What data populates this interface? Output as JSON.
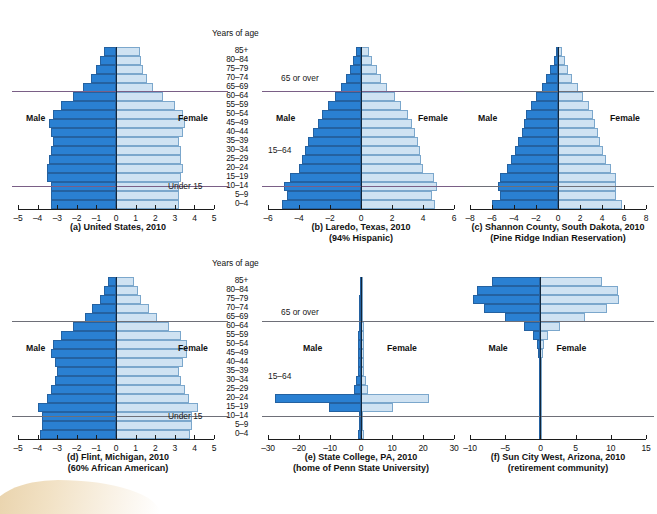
{
  "figure": {
    "age_axis_title": "Years of age",
    "age_groups": [
      "85+",
      "80–84",
      "75–79",
      "70–74",
      "65–69",
      "60–64",
      "55–59",
      "50–54",
      "45–49",
      "40–44",
      "35–39",
      "30–34",
      "25–29",
      "20–24",
      "15–19",
      "10–14",
      "5–9",
      "0–4"
    ],
    "male_label": "Male",
    "female_label": "Female",
    "note_over65": "65 or over",
    "note_15_64": "15–64",
    "note_under15": "Under 15",
    "colors": {
      "male": "#2a80d2",
      "female": "#cfe2f2",
      "male_edge": "#2461a0",
      "female_edge": "#7ba7cc",
      "axis": "#1c1c1c",
      "divider": "#6e6f78"
    }
  },
  "chart_data": [
    {
      "type": "bar",
      "id": "a",
      "title": "(a) United States, 2010",
      "subtitle": "",
      "xlabel": "",
      "ylabel": "Years of age",
      "xlim": [
        -5,
        5
      ],
      "xticks": [
        -5,
        -4,
        -3,
        -2,
        -1,
        0,
        1,
        2,
        3,
        4,
        5
      ],
      "xticklabels": [
        "–5",
        "–4",
        "–3",
        "–2",
        "–1",
        "0",
        "1",
        "2",
        "3",
        "4",
        "5"
      ],
      "categories": [
        "85+",
        "80–84",
        "75–79",
        "70–74",
        "65–69",
        "60–64",
        "55–59",
        "50–54",
        "45–49",
        "40–44",
        "35–39",
        "30–34",
        "25–29",
        "20–24",
        "15–19",
        "10–14",
        "5–9",
        "0–4"
      ],
      "series": [
        {
          "name": "Male",
          "values": [
            -0.6,
            -0.8,
            -1.0,
            -1.3,
            -1.7,
            -2.2,
            -2.8,
            -3.2,
            -3.4,
            -3.3,
            -3.2,
            -3.3,
            -3.4,
            -3.5,
            -3.5,
            -3.3,
            -3.3,
            -3.3
          ]
        },
        {
          "name": "Female",
          "values": [
            1.2,
            1.3,
            1.4,
            1.6,
            1.9,
            2.4,
            3.0,
            3.4,
            3.5,
            3.4,
            3.2,
            3.3,
            3.3,
            3.4,
            3.3,
            3.2,
            3.2,
            3.2
          ]
        }
      ],
      "dividers": [
        {
          "label": "65 or over",
          "between": "65–69/60–64"
        },
        {
          "label": "Under 15",
          "between": "15–19/10–14"
        }
      ],
      "legend": "none",
      "grid": false
    },
    {
      "type": "bar",
      "id": "b",
      "title": "(b) Laredo, Texas, 2010",
      "subtitle": "(94% Hispanic)",
      "xlim": [
        -6,
        6
      ],
      "xticks": [
        -6,
        -4,
        -2,
        0,
        2,
        4,
        6
      ],
      "xticklabels": [
        "–6",
        "–4",
        "–2",
        "0",
        "2",
        "4",
        "6"
      ],
      "categories": [
        "85+",
        "80–84",
        "75–79",
        "70–74",
        "65–69",
        "60–64",
        "55–59",
        "50–54",
        "45–49",
        "40–44",
        "35–39",
        "30–34",
        "25–29",
        "20–24",
        "15–19",
        "10–14",
        "5–9",
        "0–4"
      ],
      "series": [
        {
          "name": "Male",
          "values": [
            -0.3,
            -0.5,
            -0.7,
            -1.0,
            -1.3,
            -1.7,
            -2.1,
            -2.5,
            -2.8,
            -3.1,
            -3.4,
            -3.6,
            -3.8,
            -4.0,
            -4.6,
            -5.0,
            -4.8,
            -5.1
          ]
        },
        {
          "name": "Female",
          "values": [
            0.5,
            0.7,
            1.0,
            1.3,
            1.7,
            2.2,
            2.6,
            3.0,
            3.3,
            3.5,
            3.7,
            3.8,
            3.9,
            4.0,
            4.7,
            4.9,
            4.6,
            4.8
          ]
        }
      ],
      "dividers": [
        {
          "label": "65 or over",
          "between": "65–69/60–64"
        },
        {
          "label": "",
          "between": "15–19/10–14"
        }
      ],
      "legend": "none",
      "grid": false
    },
    {
      "type": "bar",
      "id": "c",
      "title": "(c) Shannon County, South Dakota, 2010",
      "subtitle": "(Pine Ridge Indian Reservation)",
      "xlim": [
        -8,
        8
      ],
      "xticks": [
        -8,
        -6,
        -4,
        -2,
        0,
        2,
        4,
        6,
        8
      ],
      "xticklabels": [
        "–8",
        "–6",
        "–4",
        "–2",
        "0",
        "2",
        "4",
        "6",
        "8"
      ],
      "categories": [
        "85+",
        "80–84",
        "75–79",
        "70–74",
        "65–69",
        "60–64",
        "55–59",
        "50–54",
        "45–49",
        "40–44",
        "35–39",
        "30–34",
        "25–29",
        "20–24",
        "15–19",
        "10–14",
        "5–9",
        "0–4"
      ],
      "series": [
        {
          "name": "Male",
          "values": [
            -0.2,
            -0.4,
            -0.7,
            -1.1,
            -1.5,
            -2.0,
            -2.5,
            -2.9,
            -3.1,
            -3.3,
            -3.6,
            -3.9,
            -4.3,
            -4.6,
            -5.3,
            -5.5,
            -5.3,
            -6.0
          ]
        },
        {
          "name": "Female",
          "values": [
            0.4,
            0.6,
            0.9,
            1.3,
            1.8,
            2.3,
            2.8,
            3.2,
            3.4,
            3.6,
            3.8,
            4.1,
            4.4,
            4.8,
            5.3,
            5.3,
            5.3,
            5.8
          ]
        }
      ],
      "dividers": [
        {
          "label": "",
          "between": "65–69/60–64"
        },
        {
          "label": "",
          "between": "15–19/10–14"
        }
      ],
      "legend": "none",
      "grid": false
    },
    {
      "type": "bar",
      "id": "d",
      "title": "(d) Flint, Michigan, 2010",
      "subtitle": "(60% African American)",
      "xlim": [
        -5,
        5
      ],
      "xticks": [
        -5,
        -4,
        -3,
        -2,
        -1,
        0,
        1,
        2,
        3,
        4,
        5
      ],
      "xticklabels": [
        "–5",
        "–4",
        "–3",
        "–2",
        "–1",
        "0",
        "1",
        "2",
        "3",
        "4",
        "5"
      ],
      "categories": [
        "85+",
        "80–84",
        "75–79",
        "70–74",
        "65–69",
        "60–64",
        "55–59",
        "50–54",
        "45–49",
        "40–44",
        "35–39",
        "30–34",
        "25–29",
        "20–24",
        "15–19",
        "10–14",
        "5–9",
        "0–4"
      ],
      "series": [
        {
          "name": "Male",
          "values": [
            -0.4,
            -0.6,
            -0.8,
            -1.2,
            -1.6,
            -2.2,
            -2.8,
            -3.2,
            -3.3,
            -3.1,
            -3.0,
            -3.1,
            -3.3,
            -3.5,
            -4.0,
            -3.8,
            -3.8,
            -3.9
          ]
        },
        {
          "name": "Female",
          "values": [
            0.9,
            1.1,
            1.3,
            1.7,
            2.1,
            2.7,
            3.3,
            3.6,
            3.6,
            3.4,
            3.2,
            3.3,
            3.5,
            3.7,
            4.2,
            3.9,
            3.9,
            3.8
          ]
        }
      ],
      "dividers": [
        {
          "label": "65 or over",
          "between": "65–69/60–64"
        },
        {
          "label": "Under 15",
          "between": "15–19/10–14"
        }
      ],
      "legend": "none",
      "grid": false
    },
    {
      "type": "bar",
      "id": "e",
      "title": "(e) State College, PA, 2010",
      "subtitle": "(home of Penn State University)",
      "xlim": [
        -30,
        30
      ],
      "xticks": [
        -30,
        -20,
        -10,
        0,
        10,
        20,
        30
      ],
      "xticklabels": [
        "–30",
        "–20",
        "–10",
        "0",
        "10",
        "20",
        "30"
      ],
      "categories": [
        "85+",
        "80–84",
        "75–79",
        "70–74",
        "65–69",
        "60–64",
        "55–59",
        "50–54",
        "45–49",
        "40–44",
        "35–39",
        "30–34",
        "25–29",
        "20–24",
        "15–19",
        "10–14",
        "5–9",
        "0–4"
      ],
      "series": [
        {
          "name": "Male",
          "values": [
            -0.4,
            -0.4,
            -0.5,
            -0.5,
            -0.6,
            -0.8,
            -0.9,
            -1.1,
            -1.0,
            -1.0,
            -1.1,
            -1.5,
            -2.4,
            -27.8,
            -10.2,
            -0.8,
            -0.8,
            -0.9
          ]
        },
        {
          "name": "Female",
          "values": [
            0.7,
            0.6,
            0.7,
            0.6,
            0.7,
            0.9,
            1.0,
            1.1,
            1.0,
            1.0,
            1.1,
            1.5,
            2.2,
            21.9,
            10.3,
            0.8,
            0.8,
            0.9
          ]
        }
      ],
      "dividers": [
        {
          "label": "65 or over",
          "between": "65–69/60–64"
        },
        {
          "label": "",
          "between": "15–19/10–14"
        }
      ],
      "legend": "none",
      "grid": false
    },
    {
      "type": "bar",
      "id": "f",
      "title": "(f) Sun City West, Arizona, 2010",
      "subtitle": "(retirement community)",
      "xlim": [
        -10,
        15
      ],
      "xticks": [
        -10,
        -5,
        0,
        5,
        10,
        15
      ],
      "xticklabels": [
        "–10",
        "–5",
        "0",
        "5",
        "10",
        "15"
      ],
      "categories": [
        "85+",
        "80–84",
        "75–79",
        "70–74",
        "65–69",
        "60–64",
        "55–59",
        "50–54",
        "45–49",
        "40–44",
        "35–39",
        "30–34",
        "25–29",
        "20–24",
        "15–19",
        "10–14",
        "5–9",
        "0–4"
      ],
      "series": [
        {
          "name": "Male",
          "values": [
            -6.9,
            -9.0,
            -9.6,
            -8.0,
            -5.0,
            -2.4,
            -1.0,
            -0.5,
            -0.3,
            -0.2,
            -0.2,
            -0.2,
            -0.2,
            -0.2,
            -0.2,
            -0.2,
            -0.2,
            -0.2
          ]
        },
        {
          "name": "Female",
          "values": [
            8.8,
            11.0,
            11.2,
            9.4,
            6.4,
            2.8,
            1.1,
            0.5,
            0.3,
            0.2,
            0.2,
            0.2,
            0.2,
            0.2,
            0.2,
            0.2,
            0.2,
            0.2
          ]
        }
      ],
      "dividers": [
        {
          "label": "",
          "between": "65–69/60–64"
        },
        {
          "label": "",
          "between": "15–19/10–14"
        }
      ],
      "legend": "none",
      "grid": false
    }
  ]
}
